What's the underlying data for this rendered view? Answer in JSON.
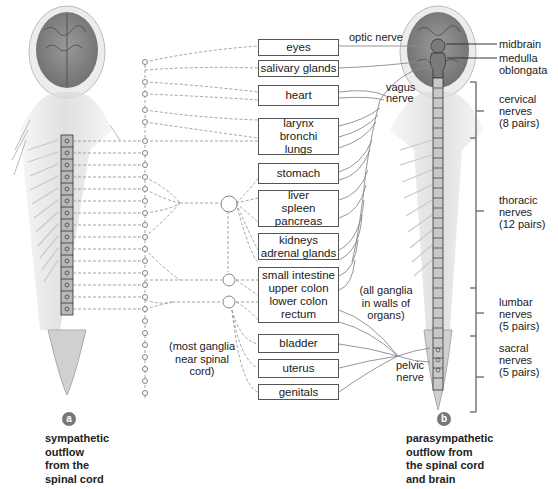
{
  "figure": {
    "panel_a": {
      "badge": "a",
      "caption_lines": [
        "sympathetic",
        "outflow",
        "from the",
        "spinal cord"
      ],
      "note_lines": [
        "(most ganglia",
        "near spinal",
        "cord)"
      ]
    },
    "panel_b": {
      "badge": "b",
      "caption_lines": [
        "parasympathetic",
        "outflow from",
        "the spinal cord",
        "and brain"
      ],
      "note_lines": [
        "(all ganglia",
        "in walls of",
        "organs)"
      ]
    },
    "organs": [
      {
        "lines": [
          "eyes"
        ]
      },
      {
        "lines": [
          "salivary glands"
        ]
      },
      {
        "lines": [
          "heart"
        ]
      },
      {
        "lines": [
          "larynx",
          "bronchi",
          "lungs"
        ]
      },
      {
        "lines": [
          "stomach"
        ]
      },
      {
        "lines": [
          "liver",
          "spleen",
          "pancreas"
        ]
      },
      {
        "lines": [
          "kidneys",
          "adrenal glands"
        ]
      },
      {
        "lines": [
          "small intestine",
          "upper colon",
          "lower colon",
          "rectum"
        ]
      },
      {
        "lines": [
          "bladder"
        ]
      },
      {
        "lines": [
          "uterus"
        ]
      },
      {
        "lines": [
          "genitals"
        ]
      }
    ],
    "nerve_labels": {
      "optic": "optic nerve",
      "vagus": [
        "vagus",
        "nerve"
      ],
      "pelvic": [
        "pelvic",
        "nerve"
      ]
    },
    "brain_labels": {
      "midbrain": "midbrain",
      "medulla": [
        "medulla",
        "oblongata"
      ]
    },
    "spinal_regions": [
      {
        "lines": [
          "cervical",
          "nerves",
          "(8 pairs)"
        ]
      },
      {
        "lines": [
          "thoracic",
          "nerves",
          "(12 pairs)"
        ]
      },
      {
        "lines": [
          "lumbar",
          "nerves",
          "(5 pairs)"
        ]
      },
      {
        "lines": [
          "sacral",
          "nerves",
          "(5 pairs)"
        ]
      }
    ],
    "colors": {
      "line": "#8a8a8a",
      "box_border": "#555555",
      "badge": "#777777",
      "anatomy": "#bdbdbd"
    }
  }
}
